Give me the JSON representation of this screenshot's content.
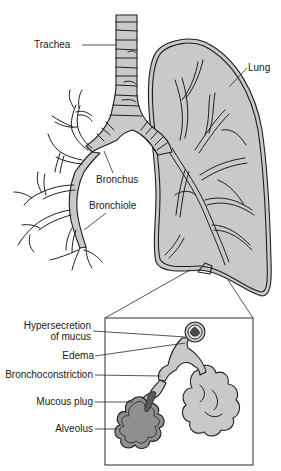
{
  "diagram": {
    "colors": {
      "background": "#ffffff",
      "tissue_fill": "#c9c9c9",
      "dark_fill": "#8f8f8f",
      "mucus_fill": "#5a5a5a",
      "stroke": "#1e1e1e"
    },
    "labels": {
      "trachea": "Trachea",
      "lung": "Lung",
      "bronchus": "Bronchus",
      "bronchiole": "Bronchiole"
    },
    "inset": {
      "labels": {
        "hypersecretion_line1": "Hypersecretion",
        "hypersecretion_line2": "of mucus",
        "edema": "Edema",
        "bronchoconstriction": "Bronchoconstriction",
        "mucous_plug": "Mucous plug",
        "alveolus": "Alveolus"
      }
    }
  }
}
